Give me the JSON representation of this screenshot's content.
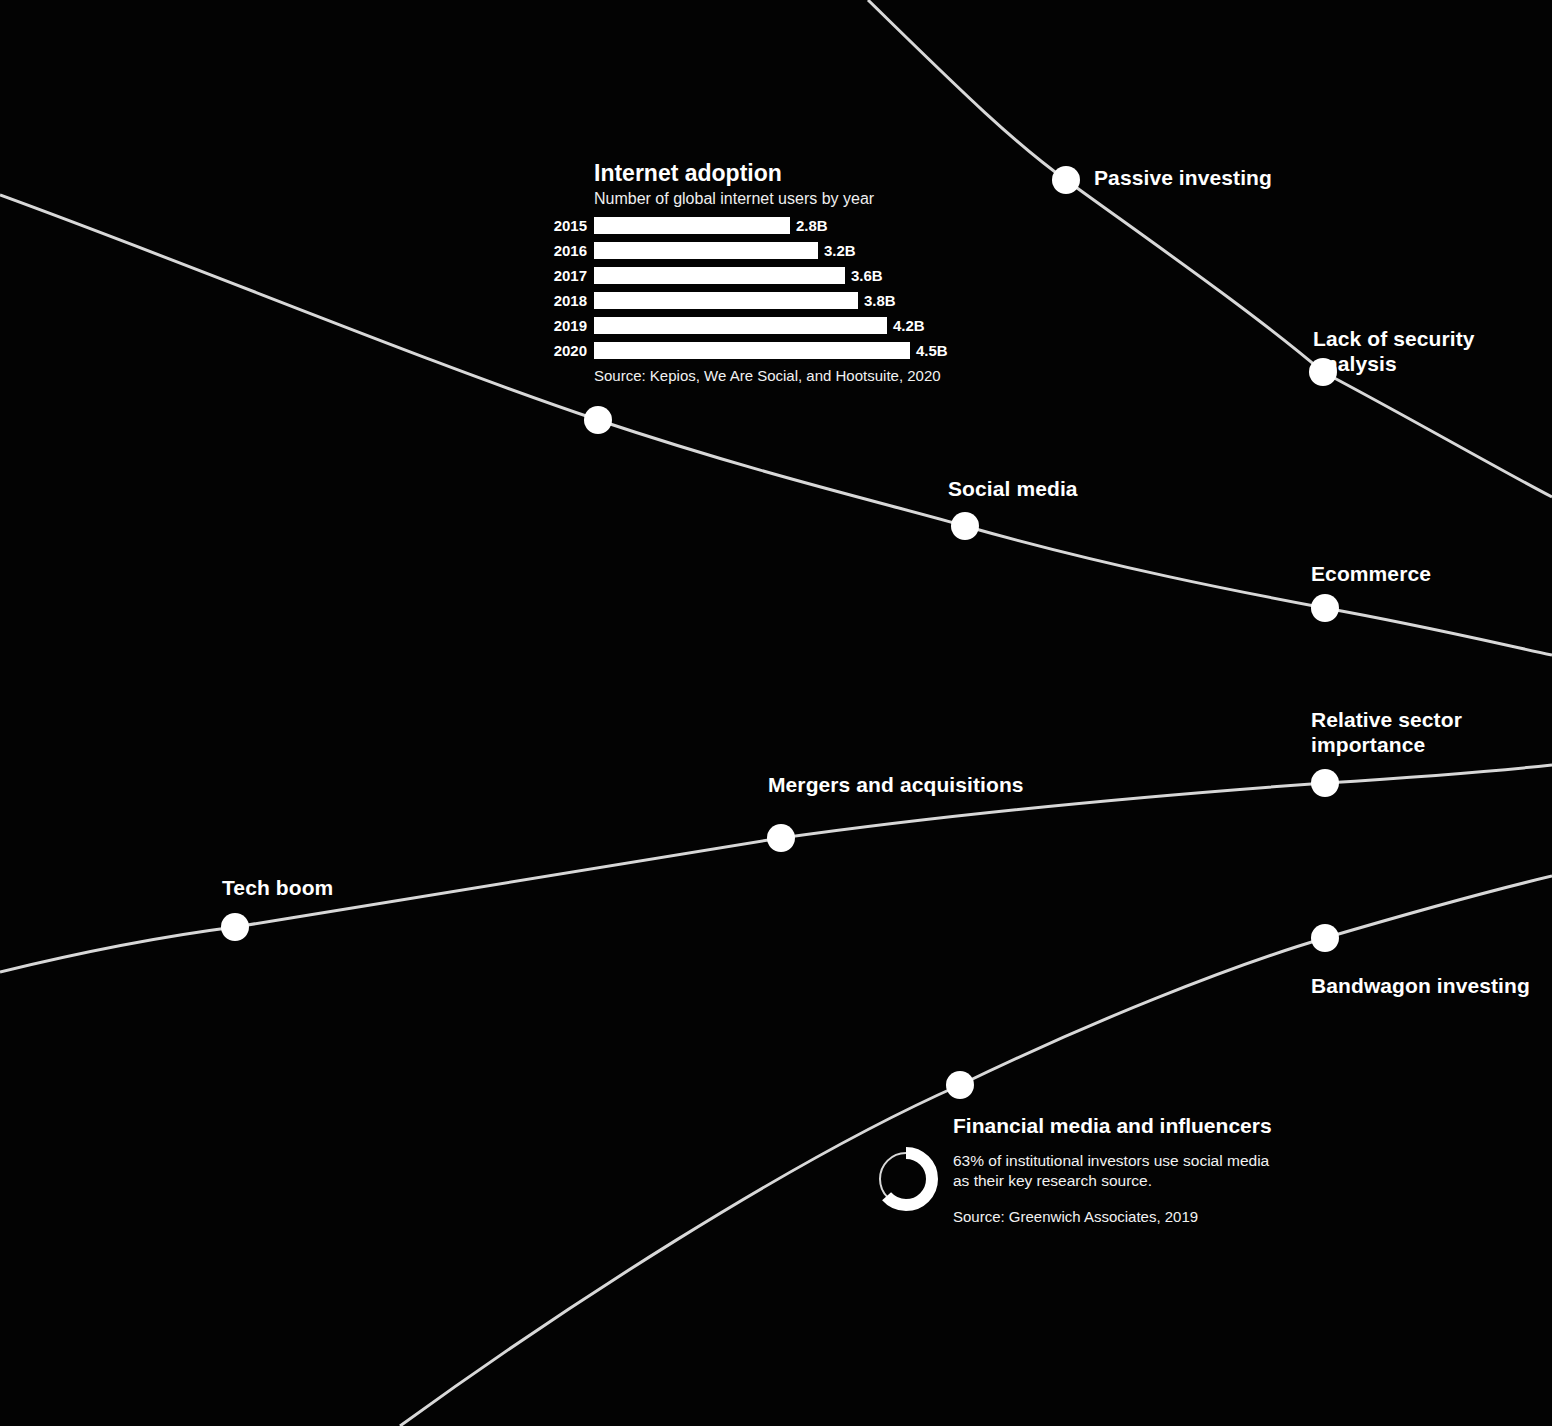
{
  "background_color": "#030303",
  "line_color": "#d8d8d8",
  "node_color": "#ffffff",
  "nodes": [
    {
      "id": "passive-investing",
      "label": "Passive investing",
      "x": 1066,
      "y": 180,
      "label_x": 1094,
      "label_y": 165,
      "align": "left"
    },
    {
      "id": "lack-of-security",
      "label": "Lack of security analysis",
      "x": 1323,
      "y": 372,
      "label_x": 1313,
      "label_y": 326,
      "align": "left"
    },
    {
      "id": "internet-adoption-node",
      "label": "",
      "x": 598,
      "y": 420,
      "label_x": 0,
      "label_y": 0,
      "align": "left"
    },
    {
      "id": "social-media",
      "label": "Social media",
      "x": 965,
      "y": 526,
      "label_x": 948,
      "label_y": 476,
      "align": "left"
    },
    {
      "id": "ecommerce",
      "label": "Ecommerce",
      "x": 1325,
      "y": 608,
      "label_x": 1311,
      "label_y": 561,
      "align": "left"
    },
    {
      "id": "relative-sector",
      "label": "Relative sector\nimportance",
      "x": 1325,
      "y": 783,
      "label_x": 1311,
      "label_y": 707,
      "align": "left"
    },
    {
      "id": "mergers-acquisitions",
      "label": "Mergers and acquisitions",
      "x": 781,
      "y": 838,
      "label_x": 768,
      "label_y": 772,
      "align": "left"
    },
    {
      "id": "tech-boom",
      "label": "Tech boom",
      "x": 235,
      "y": 927,
      "label_x": 222,
      "label_y": 875,
      "align": "left"
    },
    {
      "id": "bandwagon-investing",
      "label": "Bandwagon investing",
      "x": 1325,
      "y": 938,
      "label_x": 1311,
      "label_y": 973,
      "align": "left"
    },
    {
      "id": "financial-media",
      "label": "",
      "x": 960,
      "y": 1085,
      "label_x": 0,
      "label_y": 0,
      "align": "left"
    }
  ],
  "bar_chart": {
    "title": "Internet adoption",
    "subtitle": "Number of global internet users by year",
    "source": "Source: Kepios, We Are Social, and Hootsuite, 2020",
    "rows": [
      {
        "year": "2015",
        "value": "2.8B",
        "width": 196
      },
      {
        "year": "2016",
        "value": "3.2B",
        "width": 224
      },
      {
        "year": "2017",
        "value": "3.6B",
        "width": 251
      },
      {
        "year": "2018",
        "value": "3.8B",
        "width": 264
      },
      {
        "year": "2019",
        "value": "4.2B",
        "width": 293
      },
      {
        "year": "2020",
        "value": "4.5B",
        "width": 316
      }
    ]
  },
  "donut_card": {
    "title": "Financial media and influencers",
    "stat": "63% of institutional investors use social media as their key research source.",
    "source": "Source: Greenwich Associates, 2019",
    "percent": 63
  },
  "chart_data": [
    {
      "type": "bar",
      "title": "Internet adoption",
      "subtitle": "Number of global internet users by year",
      "xlabel": "",
      "ylabel": "Number of global internet users",
      "categories": [
        "2015",
        "2016",
        "2017",
        "2018",
        "2019",
        "2020"
      ],
      "values": [
        2.8,
        3.2,
        3.6,
        3.8,
        4.2,
        4.5
      ],
      "value_labels": [
        "2.8B",
        "3.2B",
        "3.6B",
        "3.8B",
        "4.2B",
        "4.5B"
      ],
      "unit": "billions of users",
      "orientation": "horizontal",
      "grid": false,
      "legend": "none",
      "source": "Source: Kepios, We Are Social, and Hootsuite, 2020"
    },
    {
      "type": "pie",
      "title": "Financial media and influencers",
      "subtitle": "63% of institutional investors use social media as their key research source.",
      "categories": [
        "Use social media as key research source",
        "Do not"
      ],
      "values": [
        63,
        37
      ],
      "unit": "percent",
      "legend": "none",
      "source": "Source: Greenwich Associates, 2019"
    }
  ]
}
